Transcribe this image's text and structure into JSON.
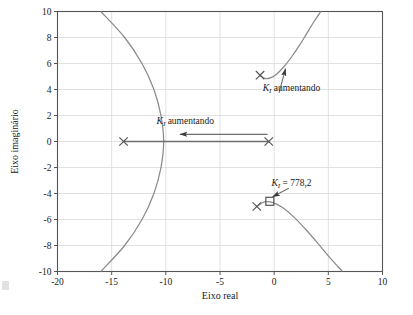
{
  "figure": {
    "kind": "root-locus-plot",
    "background": "#ffffff",
    "curve_color": "#8a8a8a",
    "arrow_color": "#6e6e6e",
    "marker_color": "#555555",
    "grid_color": "#d9d9d9",
    "axis_color": "#555555",
    "text_color": "#1a1a1a"
  },
  "chart_data": {
    "type": "scatter",
    "title": "",
    "xlabel": "Eixo real",
    "ylabel": "Eixo imaginário",
    "xlim": [
      -20,
      10
    ],
    "ylim": [
      -10,
      10
    ],
    "xticks": [
      -20,
      -15,
      -10,
      -5,
      0,
      5,
      10
    ],
    "xtick_labels": [
      "-20",
      "-15",
      "-10",
      "-5",
      "0",
      "5",
      "10"
    ],
    "yticks": [
      -10,
      -8,
      -6,
      -4,
      -2,
      0,
      2,
      4,
      6,
      8,
      10
    ],
    "ytick_labels": [
      "-10",
      "-8",
      "-6",
      "-4",
      "-2",
      "0",
      "2",
      "4",
      "6",
      "8",
      "10"
    ],
    "grid": true,
    "legend": "none",
    "open_loop_poles": [
      {
        "marker": "x",
        "real": -13.9,
        "imag": 0.0
      },
      {
        "marker": "x",
        "real": -0.5,
        "imag": 0.0
      },
      {
        "marker": "x",
        "real": -1.3,
        "imag": 5.1
      },
      {
        "marker": "x",
        "real": -1.6,
        "imag": -5.0
      }
    ],
    "selected_point": {
      "marker": "square",
      "real": -0.4,
      "imag": -4.6
    },
    "branches": [
      {
        "name": "left-real-branch",
        "description": "parabolic branch opening left, vertex near -10.2 on real axis",
        "points": [
          [
            -16.0,
            10.0
          ],
          [
            -13.8,
            8.0
          ],
          [
            -12.2,
            6.0
          ],
          [
            -11.1,
            4.0
          ],
          [
            -10.45,
            2.0
          ],
          [
            -10.2,
            0.0
          ],
          [
            -10.45,
            -2.0
          ],
          [
            -11.1,
            -4.0
          ],
          [
            -12.2,
            -6.0
          ],
          [
            -13.8,
            -8.0
          ],
          [
            -16.0,
            -10.0
          ]
        ]
      },
      {
        "name": "upper-complex-branch",
        "description": "from complex pole upward-right, exits top of axes",
        "points": [
          [
            -1.3,
            5.1
          ],
          [
            -0.85,
            4.85
          ],
          [
            -0.35,
            4.9
          ],
          [
            0.25,
            5.2
          ],
          [
            0.9,
            5.75
          ],
          [
            1.6,
            6.5
          ],
          [
            2.3,
            7.35
          ],
          [
            3.0,
            8.3
          ],
          [
            3.7,
            9.25
          ],
          [
            4.3,
            10.0
          ]
        ]
      },
      {
        "name": "lower-complex-branch",
        "description": "from complex pole downward-right, exits bottom of axes",
        "points": [
          [
            -1.6,
            -5.0
          ],
          [
            -0.9,
            -4.65
          ],
          [
            -0.1,
            -4.7
          ],
          [
            0.8,
            -5.1
          ],
          [
            1.8,
            -5.8
          ],
          [
            2.9,
            -6.75
          ],
          [
            4.0,
            -7.8
          ],
          [
            5.1,
            -8.9
          ],
          [
            6.3,
            -10.0
          ]
        ]
      },
      {
        "name": "real-axis-segment",
        "description": "segment along real axis between the two real poles with leftward arrow",
        "from": [
          -0.5,
          0.0
        ],
        "to": [
          -13.9,
          0.0
        ]
      }
    ],
    "annotations": [
      {
        "name": "ki-increasing-upper",
        "text_symbol": "K",
        "text_subscript": "I",
        "text_rest": " aumentando",
        "text_full": "K_I aumentando",
        "label_at": [
          1.6,
          3.9
        ],
        "arrow_from": [
          0.45,
          3.75
        ],
        "arrow_to": [
          1.05,
          5.6
        ]
      },
      {
        "name": "ki-increasing-real-axis",
        "text_symbol": "K",
        "text_subscript": "I",
        "text_rest": " aumentando",
        "text_full": "K_I aumentando",
        "label_at": [
          -8.2,
          1.35
        ],
        "arrow_from": [
          -0.6,
          0.55
        ],
        "arrow_to": [
          -8.7,
          0.55
        ]
      },
      {
        "name": "ki-value-callout",
        "text_symbol": "K",
        "text_subscript": "I",
        "text_rest": " = 778,2",
        "text_full": "K_I = 778,2",
        "label_at": [
          1.6,
          -3.4
        ],
        "arrow_from": [
          1.35,
          -3.6
        ],
        "arrow_to": [
          -0.15,
          -4.25
        ]
      }
    ]
  }
}
